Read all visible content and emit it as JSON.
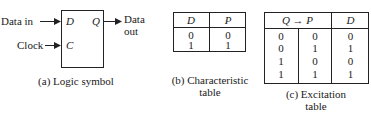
{
  "logic_symbol": {
    "inputs": [
      {
        "label": "Data in",
        "pin": "D"
      },
      {
        "label": "Clock",
        "pin": "C"
      }
    ],
    "output": {
      "pin": "Q",
      "label_line1": "Data",
      "label_line2": "out"
    },
    "caption": "(a)  Logic symbol"
  },
  "characteristic_table": {
    "headers": [
      "D",
      "P"
    ],
    "rows": [
      [
        "0",
        "0"
      ],
      [
        "1",
        "1"
      ]
    ],
    "caption_line1": "(b)  Characteristic",
    "caption_line2": "table"
  },
  "excitation_table": {
    "headers": [
      "Q → P",
      "D"
    ],
    "rows": [
      [
        "0",
        "0",
        "0"
      ],
      [
        "0",
        "1",
        "1"
      ],
      [
        "1",
        "0",
        "0"
      ],
      [
        "1",
        "1",
        "1"
      ]
    ],
    "caption_line1": "(c)  Excitation",
    "caption_line2": "table"
  }
}
